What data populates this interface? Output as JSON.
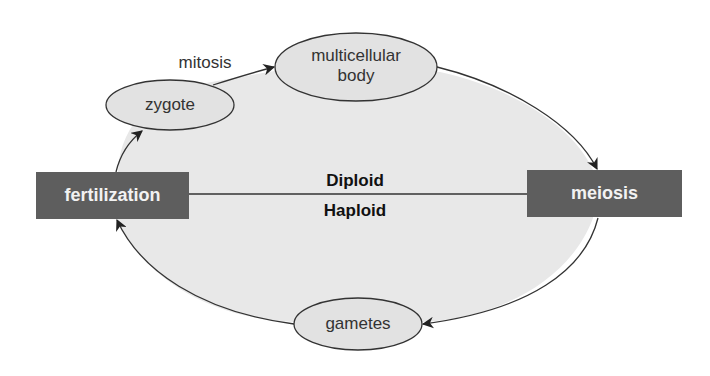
{
  "diagram": {
    "title": "",
    "colors": {
      "background": "#ffffff",
      "cycle_fill": "#e8e8e8",
      "node_fill": "#e2e2e2",
      "box_fill": "#5e5e5e",
      "box_text": "#f2f2f2",
      "stroke": "#333333"
    },
    "process_boxes": {
      "fertilization": "fertilization",
      "meiosis": "meiosis"
    },
    "nodes": {
      "zygote": "zygote",
      "multicellular_line1": "multicellular",
      "multicellular_line2": "body",
      "gametes": "gametes"
    },
    "edge_labels": {
      "mitosis": "mitosis"
    },
    "ploidy": {
      "upper": "Diploid",
      "lower": "Haploid"
    },
    "edges": [
      {
        "from": "fertilization",
        "to": "zygote"
      },
      {
        "from": "zygote",
        "to": "multicellular body",
        "label": "mitosis"
      },
      {
        "from": "multicellular body",
        "to": "meiosis"
      },
      {
        "from": "meiosis",
        "to": "gametes"
      },
      {
        "from": "gametes",
        "to": "fertilization"
      }
    ]
  }
}
